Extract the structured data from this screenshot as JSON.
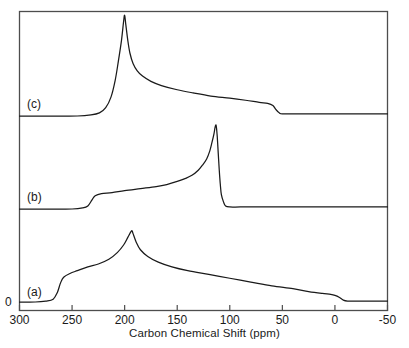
{
  "figure": {
    "background": "#ffffff",
    "line_color": "#1a1a1a",
    "frame_color": "#4d4d4d"
  },
  "axis": {
    "title": "Carbon Chemical Shift (ppm)",
    "tick_labels": [
      "300",
      "250",
      "200",
      "150",
      "100",
      "50",
      "0",
      "-50"
    ],
    "y_zero_label": "0"
  },
  "curve_labels": {
    "a": "(a)",
    "b": "(b)",
    "c": "(c)"
  },
  "chart_data": {
    "type": "line",
    "title": "",
    "xlabel": "Carbon Chemical Shift (ppm)",
    "ylabel": "",
    "xlim": [
      300,
      -50
    ],
    "x_reversed": true,
    "xticks": [
      300,
      250,
      200,
      150,
      100,
      50,
      0,
      -50
    ],
    "yticks": [
      0
    ],
    "grid": false,
    "legend": "inline-left-labels",
    "series": [
      {
        "name": "(a)",
        "label": "(a)",
        "baseline_ppm_range": [
          300,
          -50
        ],
        "peak_ppm": 193,
        "peak_height": 75,
        "onset_ppm": 265,
        "offset_ppm": -10,
        "description": "broad powder pattern with sharp apex near 193 ppm and wide tails on both sides",
        "points_ppm_height": [
          [
            300,
            0
          ],
          [
            285,
            0
          ],
          [
            275,
            1
          ],
          [
            268,
            3
          ],
          [
            264,
            10
          ],
          [
            261,
            20
          ],
          [
            258,
            26
          ],
          [
            252,
            30
          ],
          [
            245,
            33
          ],
          [
            235,
            37
          ],
          [
            225,
            40
          ],
          [
            215,
            45
          ],
          [
            207,
            52
          ],
          [
            201,
            60
          ],
          [
            197,
            68
          ],
          [
            194,
            74
          ],
          [
            193,
            75
          ],
          [
            192,
            72
          ],
          [
            189,
            63
          ],
          [
            185,
            55
          ],
          [
            178,
            48
          ],
          [
            168,
            42
          ],
          [
            155,
            37
          ],
          [
            140,
            33
          ],
          [
            120,
            29
          ],
          [
            100,
            25
          ],
          [
            80,
            21
          ],
          [
            60,
            17
          ],
          [
            40,
            14
          ],
          [
            25,
            11
          ],
          [
            12,
            9
          ],
          [
            4,
            8
          ],
          [
            0,
            7
          ],
          [
            -4,
            5
          ],
          [
            -8,
            2
          ],
          [
            -12,
            1
          ],
          [
            -20,
            1
          ],
          [
            -35,
            1
          ],
          [
            -50,
            1
          ]
        ]
      },
      {
        "name": "(b)",
        "label": "(b)",
        "baseline_ppm_range": [
          300,
          -50
        ],
        "peak_ppm": 113,
        "peak_height": 82,
        "onset_ppm": 232,
        "offset_ppm": 105,
        "description": "flat baseline until ~232 ppm, gentle rising shoulder, extremely sharp peak at 113 ppm, abrupt drop to baseline",
        "points_ppm_height": [
          [
            300,
            0
          ],
          [
            270,
            0
          ],
          [
            250,
            0
          ],
          [
            240,
            1
          ],
          [
            235,
            3
          ],
          [
            231,
            9
          ],
          [
            228,
            13
          ],
          [
            222,
            15
          ],
          [
            212,
            16
          ],
          [
            200,
            18
          ],
          [
            185,
            20
          ],
          [
            170,
            22
          ],
          [
            160,
            24
          ],
          [
            150,
            27
          ],
          [
            142,
            30
          ],
          [
            136,
            33
          ],
          [
            130,
            38
          ],
          [
            126,
            43
          ],
          [
            122,
            49
          ],
          [
            119,
            57
          ],
          [
            117,
            65
          ],
          [
            115,
            74
          ],
          [
            114,
            80
          ],
          [
            113,
            82
          ],
          [
            112,
            72
          ],
          [
            111,
            55
          ],
          [
            110,
            38
          ],
          [
            109,
            24
          ],
          [
            108,
            14
          ],
          [
            106,
            7
          ],
          [
            104,
            3
          ],
          [
            100,
            2
          ],
          [
            90,
            2
          ],
          [
            70,
            2
          ],
          [
            40,
            2
          ],
          [
            10,
            2
          ],
          [
            -20,
            2
          ],
          [
            -50,
            2
          ]
        ]
      },
      {
        "name": "(c)",
        "label": "(c)",
        "baseline_ppm_range": [
          300,
          -50
        ],
        "peak_ppm": 200,
        "peak_height": 96,
        "onset_ppm": 222,
        "offset_ppm": 55,
        "description": "flat baseline, very sharp peak at 200 ppm, long decaying tail to the right that steps down to baseline near 55 ppm",
        "points_ppm_height": [
          [
            300,
            0
          ],
          [
            270,
            0
          ],
          [
            245,
            0
          ],
          [
            232,
            1
          ],
          [
            224,
            3
          ],
          [
            218,
            8
          ],
          [
            213,
            18
          ],
          [
            209,
            34
          ],
          [
            206,
            52
          ],
          [
            203,
            72
          ],
          [
            201,
            90
          ],
          [
            200,
            96
          ],
          [
            199,
            88
          ],
          [
            197,
            72
          ],
          [
            195,
            60
          ],
          [
            192,
            50
          ],
          [
            188,
            43
          ],
          [
            183,
            38
          ],
          [
            175,
            33
          ],
          [
            165,
            29
          ],
          [
            150,
            25
          ],
          [
            135,
            22
          ],
          [
            118,
            19
          ],
          [
            100,
            17
          ],
          [
            85,
            15
          ],
          [
            72,
            13
          ],
          [
            64,
            12
          ],
          [
            59,
            10
          ],
          [
            56,
            6
          ],
          [
            53,
            3
          ],
          [
            50,
            2
          ],
          [
            40,
            2
          ],
          [
            20,
            2
          ],
          [
            0,
            2
          ],
          [
            -25,
            2
          ],
          [
            -50,
            2
          ]
        ]
      }
    ]
  }
}
